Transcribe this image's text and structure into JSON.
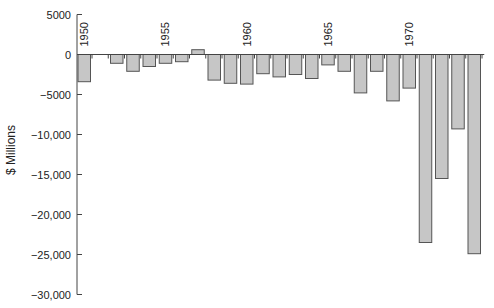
{
  "chart_data": {
    "type": "bar",
    "title": "",
    "xlabel": "",
    "ylabel": "$ Millions",
    "ylim": [
      -30000,
      5000
    ],
    "yticks": [
      5000,
      0,
      -5000,
      -10000,
      -15000,
      -20000,
      -25000,
      -30000
    ],
    "ytick_labels": [
      "5000",
      "0",
      "−5000",
      "−10,000",
      "−15,000",
      "−20,000",
      "−25,000",
      "−30,000"
    ],
    "xtick_labels": [
      "1950",
      "1955",
      "1960",
      "1965",
      "1970"
    ],
    "grid": false,
    "legend": null,
    "categories": [
      "1950",
      "1951",
      "1952",
      "1953",
      "1954",
      "1955",
      "1956",
      "1957",
      "1958",
      "1959",
      "1960",
      "1961",
      "1962",
      "1963",
      "1964",
      "1965",
      "1966",
      "1967",
      "1968",
      "1969",
      "1970",
      "1971",
      "1972",
      "1973",
      "1974"
    ],
    "values": [
      -3400,
      0,
      -1100,
      -2100,
      -1500,
      -1100,
      -900,
      600,
      -3200,
      -3600,
      -3700,
      -2400,
      -2800,
      -2500,
      -3000,
      -1300,
      -2100,
      -4800,
      -2100,
      -5800,
      -4200,
      -23500,
      -15500,
      -9300,
      -24900
    ],
    "colors": {
      "bar_fill": "#c6c6c6",
      "bar_stroke": "#555555",
      "axis": "#444444",
      "text": "#222222"
    }
  }
}
